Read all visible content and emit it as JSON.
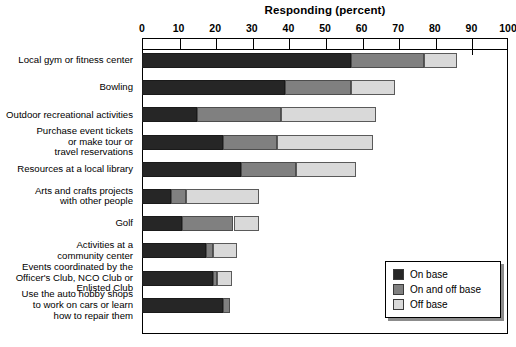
{
  "chart_data": {
    "type": "bar",
    "orientation": "horizontal",
    "stacked": true,
    "title": "Responding (percent)",
    "xlabel": "",
    "ylabel": "",
    "xlim": [
      0,
      100
    ],
    "xticks": [
      0,
      10,
      20,
      30,
      40,
      50,
      60,
      70,
      80,
      90,
      100
    ],
    "grid": false,
    "legend_position": "bottom-right",
    "categories": [
      "Local gym or fitness center",
      "Bowling",
      "Outdoor recreational activities",
      "Purchase event tickets\nor make tour or\ntravel reservations",
      "Resources at a local library",
      "Arts and crafts projects\nwith other people",
      "Golf",
      "Activities at a\ncommunity center",
      "Events coordinated by the\nOfficer's Club, NCO Club or\nEnlisted Club",
      "Use the auto hobby shops\nto work on cars or learn\nhow to repair them"
    ],
    "series": [
      {
        "name": "On base",
        "color": "#262626",
        "values": [
          57,
          39,
          15,
          22,
          27,
          8,
          11,
          17.5,
          19.5,
          22
        ]
      },
      {
        "name": "On and off base",
        "color": "#808080",
        "values": [
          20,
          18,
          23,
          15,
          15,
          4,
          14,
          2,
          1,
          2
        ]
      },
      {
        "name": "Off base",
        "color": "#d9d9d9",
        "values": [
          9,
          12,
          26,
          26,
          16.5,
          20,
          7,
          6.5,
          4,
          0
        ]
      }
    ],
    "totals": [
      86,
      69,
      64,
      63,
      58.5,
      32,
      32,
      26,
      24.5,
      24
    ]
  },
  "legend": {
    "items": [
      {
        "label": "On base",
        "color": "#262626"
      },
      {
        "label": "On and off base",
        "color": "#808080"
      },
      {
        "label": "Off base",
        "color": "#d9d9d9"
      }
    ]
  }
}
